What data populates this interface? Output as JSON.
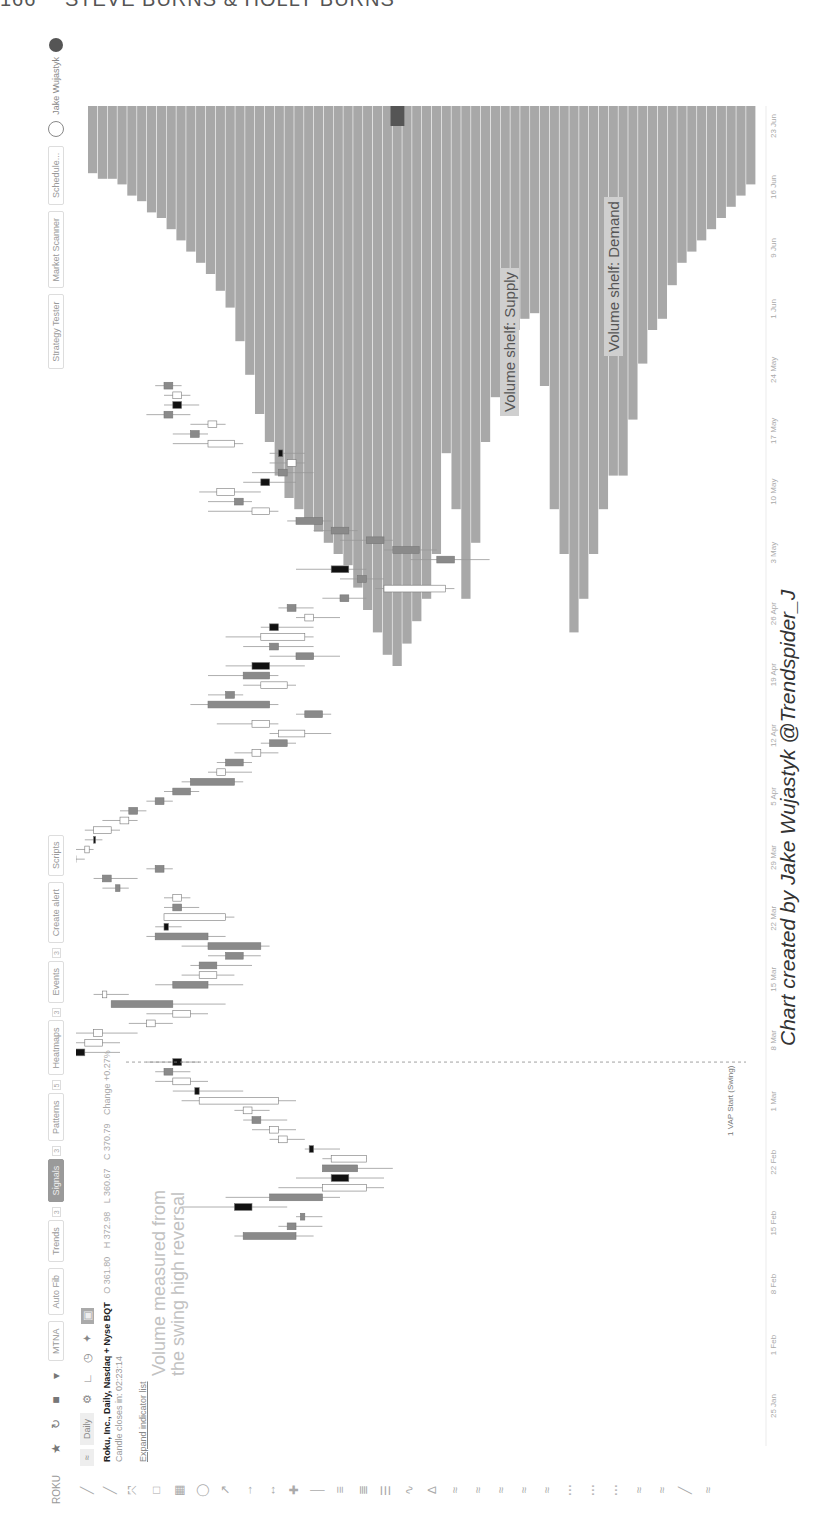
{
  "page_header": {
    "page_number": "166",
    "authors": "STEVE BURNS & HOLLY BURNS"
  },
  "toolbar": {
    "symbol": "ROKU",
    "icons": [
      "star-icon",
      "refresh-icon",
      "chart-type-icon",
      "dropdown-icon"
    ],
    "buttons": [
      {
        "label": "MTNA",
        "active": false
      },
      {
        "label": "Auto Fib",
        "active": false
      },
      {
        "label": "Trends",
        "active": false,
        "count": "3"
      },
      {
        "label": "Signals",
        "active": true,
        "count": "3"
      },
      {
        "label": "Patterns",
        "active": false,
        "count": "5"
      },
      {
        "label": "Heatmaps",
        "active": false,
        "count": "3"
      },
      {
        "label": "Events",
        "active": false,
        "count": "3"
      },
      {
        "label": "Create alert",
        "active": false
      },
      {
        "label": "Scripts",
        "active": false
      }
    ],
    "right_buttons": [
      "Strategy Tester",
      "Market Scanner",
      "Schedule..."
    ],
    "user_name": "Jake Wujastyk"
  },
  "subbar": {
    "compare_label": "≈",
    "interval": "Daily",
    "icons": [
      "settings-icon",
      "magnet-icon",
      "clock-icon",
      "pin-icon",
      "camera-icon"
    ]
  },
  "legend": {
    "title": "Roku, Inc., Daily, Nasdaq + Nyse BQT",
    "open": "O 361.80",
    "high": "H 372.98",
    "low": "L 360.67",
    "close": "C 370.79",
    "change": "Change +0.27%",
    "candle_close": "Candle closes in: 02:23:14",
    "expand": "Expand indicator list"
  },
  "annotations": {
    "swing_note_line1": "Volume measured from",
    "swing_note_line2": "the swing high reversal",
    "supply_label": "Volume shelf: Supply",
    "demand_label": "Volume shelf: Demand",
    "vap_label": "1 VAP Start (Swing)",
    "poc_label": "370.79",
    "credit": "Chart created by Jake Wujastyk @Trendspider_J"
  },
  "colors": {
    "profile_fill": "#a8a8a8",
    "candle_up": "#ffffff",
    "candle_down": "#8a8a8a",
    "candle_strong": "#111111",
    "wick": "#999999",
    "vap_line": "#888888"
  },
  "chart_data": {
    "type": "candlestick+volume_profile",
    "title": "Roku, Inc., Daily, Nasdaq + Nyse BQT",
    "xlabel": "Date",
    "ylabel": "Price",
    "x_ticks": [
      "25 Jan",
      "1 Feb",
      "8 Feb",
      "15 Feb",
      "22 Feb",
      "1 Mar",
      "8 Mar",
      "15 Mar",
      "22 Mar",
      "29 Mar",
      "5 Apr",
      "12 Apr",
      "19 Apr",
      "26 Apr",
      "3 May",
      "10 May",
      "17 May",
      "24 May",
      "1 Jun",
      "9 Jun",
      "16 Jun",
      "23 Jun"
    ],
    "candles_normalized": [
      {
        "o": 0.5,
        "h": 0.52,
        "l": 0.43,
        "c": 0.44,
        "t": "d"
      },
      {
        "o": 0.5,
        "h": 0.53,
        "l": 0.48,
        "c": 0.49,
        "t": "d"
      },
      {
        "o": 0.51,
        "h": 0.53,
        "l": 0.5,
        "c": 0.505,
        "t": "d"
      },
      {
        "o": 0.45,
        "h": 0.49,
        "l": 0.37,
        "c": 0.43,
        "t": "s"
      },
      {
        "o": 0.53,
        "h": 0.55,
        "l": 0.42,
        "c": 0.47,
        "t": "d"
      },
      {
        "o": 0.53,
        "h": 0.6,
        "l": 0.48,
        "c": 0.58,
        "t": "u"
      },
      {
        "o": 0.56,
        "h": 0.6,
        "l": 0.5,
        "c": 0.54,
        "t": "s"
      },
      {
        "o": 0.57,
        "h": 0.61,
        "l": 0.54,
        "c": 0.53,
        "t": "d"
      },
      {
        "o": 0.54,
        "h": 0.58,
        "l": 0.53,
        "c": 0.58,
        "t": "u"
      },
      {
        "o": 0.52,
        "h": 0.55,
        "l": 0.51,
        "c": 0.515,
        "t": "s"
      },
      {
        "o": 0.48,
        "h": 0.51,
        "l": 0.47,
        "c": 0.49,
        "t": "u"
      },
      {
        "o": 0.47,
        "h": 0.5,
        "l": 0.45,
        "c": 0.48,
        "t": "u"
      },
      {
        "o": 0.46,
        "h": 0.49,
        "l": 0.44,
        "c": 0.45,
        "t": "d"
      },
      {
        "o": 0.44,
        "h": 0.47,
        "l": 0.43,
        "c": 0.45,
        "t": "u"
      },
      {
        "o": 0.39,
        "h": 0.5,
        "l": 0.37,
        "c": 0.48,
        "t": "u"
      },
      {
        "o": 0.39,
        "h": 0.44,
        "l": 0.36,
        "c": 0.385,
        "t": "s"
      },
      {
        "o": 0.36,
        "h": 0.4,
        "l": 0.34,
        "c": 0.38,
        "t": "u"
      },
      {
        "o": 0.36,
        "h": 0.38,
        "l": 0.34,
        "c": 0.35,
        "t": "d"
      },
      {
        "o": 0.37,
        "h": 0.39,
        "l": 0.33,
        "c": 0.36,
        "t": "s"
      },
      {
        "o": 0.26,
        "h": 0.3,
        "l": 0.2,
        "c": 0.24,
        "t": "s"
      },
      {
        "o": 0.26,
        "h": 0.3,
        "l": 0.25,
        "c": 0.28,
        "t": "u"
      },
      {
        "o": 0.27,
        "h": 0.32,
        "l": 0.25,
        "c": 0.28,
        "t": "u"
      },
      {
        "o": 0.33,
        "h": 0.36,
        "l": 0.31,
        "c": 0.34,
        "t": "u"
      },
      {
        "o": 0.36,
        "h": 0.4,
        "l": 0.33,
        "c": 0.38,
        "t": "u"
      },
      {
        "o": 0.36,
        "h": 0.42,
        "l": 0.3,
        "c": 0.29,
        "t": "d"
      },
      {
        "o": 0.28,
        "h": 0.31,
        "l": 0.27,
        "c": 0.285,
        "t": "u"
      },
      {
        "o": 0.4,
        "h": 0.44,
        "l": 0.34,
        "c": 0.36,
        "t": "d"
      },
      {
        "o": 0.39,
        "h": 0.43,
        "l": 0.37,
        "c": 0.41,
        "t": "u"
      },
      {
        "o": 0.41,
        "h": 0.45,
        "l": 0.38,
        "c": 0.39,
        "t": "d"
      },
      {
        "o": 0.44,
        "h": 0.46,
        "l": 0.4,
        "c": 0.42,
        "t": "d"
      },
      {
        "o": 0.4,
        "h": 0.47,
        "l": 0.37,
        "c": 0.46,
        "t": "d"
      },
      {
        "o": 0.34,
        "h": 0.42,
        "l": 0.33,
        "c": 0.4,
        "t": "d"
      },
      {
        "o": 0.35,
        "h": 0.37,
        "l": 0.34,
        "c": 0.355,
        "t": "s"
      },
      {
        "o": 0.35,
        "h": 0.43,
        "l": 0.35,
        "c": 0.42,
        "t": "u"
      },
      {
        "o": 0.37,
        "h": 0.39,
        "l": 0.35,
        "c": 0.36,
        "t": "d"
      },
      {
        "o": 0.36,
        "h": 0.38,
        "l": 0.35,
        "c": 0.37,
        "t": "u"
      },
      {
        "o": 0.3,
        "h": 0.31,
        "l": 0.28,
        "c": 0.295,
        "t": "d"
      },
      {
        "o": 0.29,
        "h": 0.32,
        "l": 0.27,
        "c": 0.28,
        "t": "d"
      },
      {
        "o": 0.34,
        "h": 0.36,
        "l": 0.33,
        "c": 0.35,
        "t": "d"
      },
      {
        "o": 0.25,
        "h": 0.26,
        "l": 0.23,
        "c": 0.24,
        "t": "d"
      },
      {
        "o": 0.26,
        "h": 0.27,
        "l": 0.25,
        "c": 0.265,
        "t": "u"
      },
      {
        "o": 0.27,
        "h": 0.28,
        "l": 0.26,
        "c": 0.27,
        "t": "s"
      },
      {
        "o": 0.27,
        "h": 0.3,
        "l": 0.26,
        "c": 0.29,
        "t": "u"
      },
      {
        "o": 0.3,
        "h": 0.32,
        "l": 0.28,
        "c": 0.31,
        "t": "u"
      },
      {
        "o": 0.31,
        "h": 0.33,
        "l": 0.3,
        "c": 0.32,
        "t": "d"
      },
      {
        "o": 0.34,
        "h": 0.36,
        "l": 0.33,
        "c": 0.35,
        "t": "d"
      },
      {
        "o": 0.36,
        "h": 0.39,
        "l": 0.35,
        "c": 0.38,
        "t": "d"
      },
      {
        "o": 0.38,
        "h": 0.44,
        "l": 0.37,
        "c": 0.43,
        "t": "d"
      },
      {
        "o": 0.42,
        "h": 0.45,
        "l": 0.4,
        "c": 0.41,
        "t": "u"
      },
      {
        "o": 0.42,
        "h": 0.45,
        "l": 0.41,
        "c": 0.44,
        "t": "d"
      },
      {
        "o": 0.45,
        "h": 0.48,
        "l": 0.43,
        "c": 0.46,
        "t": "u"
      },
      {
        "o": 0.49,
        "h": 0.5,
        "l": 0.46,
        "c": 0.47,
        "t": "d"
      },
      {
        "o": 0.51,
        "h": 0.54,
        "l": 0.47,
        "c": 0.48,
        "t": "u"
      },
      {
        "o": 0.45,
        "h": 0.48,
        "l": 0.41,
        "c": 0.47,
        "t": "u"
      },
      {
        "o": 0.51,
        "h": 0.54,
        "l": 0.5,
        "c": 0.53,
        "t": "d"
      },
      {
        "o": 0.4,
        "h": 0.48,
        "l": 0.38,
        "c": 0.47,
        "t": "d"
      },
      {
        "o": 0.42,
        "h": 0.44,
        "l": 0.4,
        "c": 0.43,
        "t": "d"
      },
      {
        "o": 0.46,
        "h": 0.5,
        "l": 0.44,
        "c": 0.49,
        "t": "u"
      },
      {
        "o": 0.44,
        "h": 0.48,
        "l": 0.4,
        "c": 0.47,
        "t": "d"
      },
      {
        "o": 0.47,
        "h": 0.51,
        "l": 0.42,
        "c": 0.45,
        "t": "s"
      },
      {
        "o": 0.5,
        "h": 0.55,
        "l": 0.47,
        "c": 0.52,
        "t": "d"
      },
      {
        "o": 0.48,
        "h": 0.52,
        "l": 0.44,
        "c": 0.47,
        "t": "d"
      },
      {
        "o": 0.46,
        "h": 0.52,
        "l": 0.42,
        "c": 0.51,
        "t": "u"
      },
      {
        "o": 0.48,
        "h": 0.52,
        "l": 0.46,
        "c": 0.47,
        "t": "s"
      },
      {
        "o": 0.52,
        "h": 0.55,
        "l": 0.5,
        "c": 0.51,
        "t": "u"
      },
      {
        "o": 0.5,
        "h": 0.52,
        "l": 0.48,
        "c": 0.49,
        "t": "d"
      },
      {
        "o": 0.56,
        "h": 0.58,
        "l": 0.53,
        "c": 0.55,
        "t": "d"
      },
      {
        "o": 0.6,
        "h": 0.68,
        "l": 0.59,
        "c": 0.67,
        "t": "u"
      },
      {
        "o": 0.58,
        "h": 0.6,
        "l": 0.55,
        "c": 0.57,
        "t": "d"
      },
      {
        "o": 0.54,
        "h": 0.58,
        "l": 0.5,
        "c": 0.56,
        "t": "s"
      },
      {
        "o": 0.66,
        "h": 0.72,
        "l": 0.63,
        "c": 0.68,
        "t": "d"
      },
      {
        "o": 0.61,
        "h": 0.66,
        "l": 0.6,
        "c": 0.64,
        "t": "d"
      },
      {
        "o": 0.58,
        "h": 0.61,
        "l": 0.55,
        "c": 0.6,
        "t": "d"
      },
      {
        "o": 0.54,
        "h": 0.57,
        "l": 0.52,
        "c": 0.56,
        "t": "d"
      },
      {
        "o": 0.5,
        "h": 0.54,
        "l": 0.49,
        "c": 0.53,
        "t": "d"
      },
      {
        "o": 0.45,
        "h": 0.48,
        "l": 0.4,
        "c": 0.47,
        "t": "u"
      },
      {
        "o": 0.43,
        "h": 0.45,
        "l": 0.4,
        "c": 0.44,
        "t": "d"
      },
      {
        "o": 0.41,
        "h": 0.46,
        "l": 0.39,
        "c": 0.43,
        "t": "u"
      },
      {
        "o": 0.47,
        "h": 0.5,
        "l": 0.44,
        "c": 0.46,
        "t": "s"
      },
      {
        "o": 0.49,
        "h": 0.52,
        "l": 0.45,
        "c": 0.48,
        "t": "d"
      },
      {
        "o": 0.49,
        "h": 0.51,
        "l": 0.47,
        "c": 0.5,
        "t": "u"
      },
      {
        "o": 0.48,
        "h": 0.51,
        "l": 0.47,
        "c": 0.485,
        "t": "s"
      },
      {
        "o": 0.4,
        "h": 0.44,
        "l": 0.36,
        "c": 0.43,
        "t": "u"
      },
      {
        "o": 0.38,
        "h": 0.4,
        "l": 0.36,
        "c": 0.39,
        "t": "d"
      },
      {
        "o": 0.4,
        "h": 0.42,
        "l": 0.38,
        "c": 0.41,
        "t": "u"
      },
      {
        "o": 0.35,
        "h": 0.38,
        "l": 0.33,
        "c": 0.36,
        "t": "d"
      },
      {
        "o": 0.37,
        "h": 0.39,
        "l": 0.35,
        "c": 0.36,
        "t": "s"
      },
      {
        "o": 0.36,
        "h": 0.38,
        "l": 0.35,
        "c": 0.37,
        "t": "u"
      },
      {
        "o": 0.35,
        "h": 0.37,
        "l": 0.34,
        "c": 0.36,
        "t": "d"
      }
    ],
    "volume_profile_normalized": [
      0.12,
      0.13,
      0.13,
      0.14,
      0.16,
      0.17,
      0.19,
      0.2,
      0.22,
      0.24,
      0.26,
      0.28,
      0.3,
      0.33,
      0.36,
      0.42,
      0.48,
      0.55,
      0.6,
      0.66,
      0.7,
      0.72,
      0.74,
      0.76,
      0.78,
      0.8,
      0.82,
      0.86,
      0.9,
      0.94,
      0.98,
      1.0,
      0.96,
      0.92,
      0.88,
      0.8,
      0.62,
      0.72,
      0.88,
      0.78,
      0.6,
      0.52,
      0.42,
      0.4,
      0.38,
      0.37,
      0.5,
      0.72,
      0.8,
      0.94,
      0.88,
      0.8,
      0.72,
      0.66,
      0.66,
      0.56,
      0.46,
      0.4,
      0.38,
      0.32,
      0.28,
      0.26,
      0.24,
      0.22,
      0.2,
      0.18,
      0.16,
      0.14
    ],
    "poc_price_label": "370.79",
    "vap_start": "Swing high reversal (~12 Feb)"
  }
}
